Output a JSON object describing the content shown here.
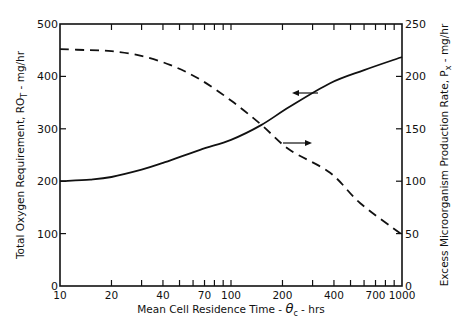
{
  "chart_data": {
    "type": "line",
    "title": "",
    "xlabel": "Mean Cell Residence Time - θc - hrs",
    "ylabel": "Total Oxygen Requirement, RO_T - mg/hr",
    "y2label": "Excess Microorganism Production Rate, P_x - mg/hr",
    "xscale": "log",
    "xlim": [
      10,
      1000
    ],
    "ylim": [
      0,
      500
    ],
    "y2lim": [
      0,
      250
    ],
    "xticks": [
      10,
      20,
      40,
      70,
      100,
      200,
      400,
      700,
      1000
    ],
    "xminor_ticks": [
      30,
      50,
      60,
      80,
      90,
      300,
      500,
      600,
      800,
      900
    ],
    "yticks": [
      0,
      100,
      200,
      300,
      400,
      500
    ],
    "y2ticks": [
      0,
      50,
      100,
      150,
      200,
      250
    ],
    "grid": false,
    "series": [
      {
        "name": "Total Oxygen Requirement (RO_T)",
        "axis": "left",
        "style": "solid",
        "x": [
          10,
          15,
          20,
          30,
          40,
          66,
          100,
          150,
          220,
          380,
          600,
          1000
        ],
        "values": [
          200,
          203,
          208,
          222,
          235,
          260,
          279,
          307,
          342,
          387,
          412,
          437
        ]
      },
      {
        "name": "Excess Microorganism Production Rate (P_x)",
        "axis": "right",
        "style": "dashed",
        "x": [
          10,
          15,
          20,
          29,
          44,
          66,
          100,
          150,
          220,
          380,
          570,
          1000
        ],
        "values": [
          226,
          225,
          224,
          220,
          211,
          197,
          177,
          154,
          130,
          108,
          79,
          49
        ]
      }
    ],
    "annotations": [
      {
        "type": "arrow",
        "direction": "left",
        "note": "solid curve refers to left axis"
      },
      {
        "type": "arrow",
        "direction": "right",
        "note": "dashed curve refers to right axis"
      }
    ]
  },
  "labels": {
    "x_ticks": [
      "10",
      "20",
      "40",
      "70",
      "100",
      "200",
      "400",
      "700",
      "1000"
    ],
    "y_ticks": [
      "0",
      "100",
      "200",
      "300",
      "400",
      "500"
    ],
    "y2_ticks": [
      "0",
      "50",
      "100",
      "150",
      "200",
      "250"
    ],
    "x_title_main": "Mean Cell Residence Time - ",
    "x_title_theta": "θ",
    "x_title_sub": "c",
    "x_title_tail": " - hrs",
    "y_title_main": "Total Oxygen Requirement, RO",
    "y_title_sub": "T",
    "y_title_tail": " - mg/hr",
    "y2_title_main": "Excess Microorganism Production Rate, P",
    "y2_title_sub": "x",
    "y2_title_tail": " - mg/hr"
  }
}
